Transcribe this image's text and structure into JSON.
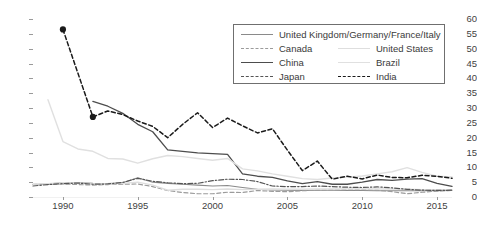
{
  "chart_data": {
    "type": "line",
    "title": "",
    "xlabel": "",
    "ylabel": "",
    "xlim": [
      1988,
      2016
    ],
    "ylim": [
      0,
      60
    ],
    "grid": true,
    "legend_position": "top-right",
    "x": [
      1988,
      1989,
      1990,
      1991,
      1992,
      1993,
      1994,
      1995,
      1996,
      1997,
      1998,
      1999,
      2000,
      2001,
      2002,
      2003,
      2004,
      2005,
      2006,
      2007,
      2008,
      2009,
      2010,
      2011,
      2012,
      2013,
      2014,
      2015,
      2016
    ],
    "yticks": [
      0,
      5,
      10,
      15,
      20,
      25,
      30,
      35,
      40,
      45,
      50,
      55,
      60
    ],
    "xticks": [
      1990,
      1995,
      2000,
      2005,
      2010,
      2015
    ],
    "series": [
      {
        "name": "United Kingdom/Germany/France/Italy",
        "color": "#8a8a8a",
        "style": "solid",
        "width": 1.1,
        "markers": false,
        "x": [
          1988,
          1989,
          1990,
          1991,
          1992,
          1993,
          1994,
          1995,
          1996,
          1997,
          1998,
          1999,
          2000,
          2001,
          2002,
          2003,
          2004,
          2005,
          2006,
          2007,
          2008,
          2009,
          2010,
          2011,
          2012,
          2013,
          2014,
          2015,
          2016
        ],
        "values": [
          4.2,
          4.4,
          4.9,
          4.9,
          4.6,
          4.5,
          4.8,
          6.5,
          5.0,
          4.6,
          4.3,
          4.0,
          3.7,
          3.9,
          3.2,
          2.6,
          2.4,
          2.3,
          2.2,
          2.3,
          2.3,
          2.2,
          2.2,
          2.1,
          2.1,
          2.1,
          2.1,
          2.1,
          2.2
        ]
      },
      {
        "name": "Canada",
        "color": "#9b9b9b",
        "style": "dashed",
        "width": 1.2,
        "markers": false,
        "x": [
          1988,
          1989,
          1990,
          1991,
          1992,
          1993,
          1994,
          1995,
          1996,
          1997,
          1998,
          1999,
          2000,
          2001,
          2002,
          2003,
          2004,
          2005,
          2006,
          2007,
          2008,
          2009,
          2010,
          2011,
          2012,
          2013,
          2014,
          2015,
          2016
        ],
        "values": [
          4.3,
          4.3,
          4.4,
          4.2,
          4.0,
          4.2,
          4.3,
          4.4,
          3.5,
          2.2,
          1.5,
          1.1,
          1.1,
          1.6,
          1.5,
          2.2,
          1.9,
          1.8,
          2.1,
          2.3,
          2.4,
          2.5,
          2.5,
          2.3,
          1.8,
          1.1,
          1.6,
          2.0,
          2.2
        ]
      },
      {
        "name": "United States",
        "color": "#dedede",
        "style": "solid",
        "width": 1.4,
        "markers": false,
        "x": [
          1988,
          1989,
          1990,
          1991,
          1992,
          1993,
          1994,
          1995,
          1996,
          1997,
          1998,
          1999,
          2000,
          2001,
          2002,
          2003,
          2004,
          2005,
          2006,
          2007,
          2008,
          2009,
          2010,
          2011,
          2012,
          2013,
          2014,
          2015,
          2016
        ],
        "values": [
          4.3,
          4.5,
          4.8,
          4.7,
          4.5,
          4.4,
          4.6,
          5.0,
          4.0,
          2.3,
          2.6,
          2.6,
          2.5,
          2.7,
          2.5,
          2.6,
          2.7,
          2.6,
          2.6,
          2.7,
          2.7,
          2.7,
          2.7,
          2.7,
          2.7,
          2.6,
          2.5,
          2.5,
          2.5
        ]
      },
      {
        "name": "China",
        "color": "#4d4d4d",
        "style": "solid",
        "width": 1.3,
        "markers": false,
        "x": [
          1992,
          1993,
          1994,
          1995,
          1996,
          1997,
          1998,
          1999,
          2000,
          2001,
          2002,
          2003,
          2004,
          2005,
          2006,
          2007,
          2008,
          2009,
          2010,
          2011,
          2012,
          2013,
          2014,
          2015,
          2016
        ],
        "values": [
          32.2,
          30.6,
          28.2,
          24.5,
          22.0,
          15.9,
          15.4,
          14.9,
          14.6,
          14.4,
          7.8,
          7.0,
          6.6,
          5.4,
          4.5,
          5.2,
          4.3,
          4.3,
          5.0,
          5.9,
          5.6,
          6.0,
          6.2,
          4.6,
          3.6
        ]
      },
      {
        "name": "Brazil",
        "color": "#e0e0e0",
        "style": "solid",
        "width": 1.4,
        "markers": false,
        "x": [
          1989,
          1990,
          1991,
          1992,
          1993,
          1994,
          1995,
          1996,
          1997,
          1998,
          1999,
          2000,
          2001,
          2002,
          2003,
          2004,
          2005,
          2006,
          2007,
          2008,
          2009,
          2010,
          2011,
          2012,
          2013,
          2014,
          2015,
          2016
        ],
        "values": [
          32.8,
          18.7,
          16.2,
          15.4,
          13.0,
          12.8,
          11.4,
          12.9,
          14.0,
          13.6,
          13.0,
          12.4,
          13.0,
          9.5,
          8.8,
          7.8,
          7.0,
          6.2,
          5.9,
          6.4,
          6.7,
          7.1,
          7.8,
          8.5,
          9.9,
          8.3,
          7.0,
          6.8
        ]
      },
      {
        "name": "Japan",
        "color": "#555555",
        "style": "dashdot",
        "width": 1.2,
        "markers": false,
        "x": [
          1988,
          1989,
          1990,
          1991,
          1992,
          1993,
          1994,
          1995,
          1996,
          1997,
          1998,
          1999,
          2000,
          2001,
          2002,
          2003,
          2004,
          2005,
          2006,
          2007,
          2008,
          2009,
          2010,
          2011,
          2012,
          2013,
          2014,
          2015,
          2016
        ],
        "values": [
          3.7,
          4.2,
          4.5,
          4.7,
          4.3,
          4.4,
          4.9,
          6.3,
          5.3,
          4.8,
          4.5,
          4.6,
          5.5,
          6.0,
          5.9,
          5.2,
          3.7,
          3.5,
          3.5,
          3.7,
          3.5,
          3.3,
          3.2,
          3.4,
          3.1,
          2.6,
          2.3,
          2.2,
          2.3
        ]
      },
      {
        "name": "India",
        "color": "#1a1a1a",
        "style": "dashed",
        "width": 1.5,
        "markers": true,
        "x": [
          1990,
          1992,
          1993,
          1994,
          1995,
          1996,
          1997,
          1998,
          1999,
          2000,
          2001,
          2002,
          2003,
          2004,
          2005,
          2006,
          2007,
          2008,
          2009,
          2010,
          2011,
          2012,
          2013,
          2014,
          2015,
          2016
        ],
        "values": [
          56.5,
          27.0,
          29.0,
          27.8,
          25.6,
          23.8,
          20.0,
          24.5,
          28.4,
          23.4,
          26.6,
          24.0,
          21.6,
          23.0,
          15.8,
          8.9,
          12.1,
          6.0,
          7.0,
          6.1,
          7.4,
          6.6,
          6.5,
          7.3,
          7.0,
          6.3
        ],
        "marker_points": [
          {
            "x": 1990,
            "y": 56.5
          },
          {
            "x": 1992,
            "y": 27.0
          }
        ]
      }
    ]
  },
  "axes": {
    "ytick_labels": [
      "60",
      "55",
      "50",
      "45",
      "40",
      "35",
      "30",
      "25",
      "20",
      "15",
      "10",
      "5",
      "0"
    ],
    "xtick_labels": [
      "1990",
      "1995",
      "2000",
      "2005",
      "2010",
      "2015"
    ]
  },
  "legend": {
    "rows": [
      {
        "label": "United Kingdom/Germany/France/Italy",
        "series": 0
      },
      {
        "label": "Canada",
        "series": 1
      },
      {
        "label": "United States",
        "series": 2
      },
      {
        "label": "China",
        "series": 3
      },
      {
        "label": "Brazil",
        "series": 4
      },
      {
        "label": "Japan",
        "series": 5
      },
      {
        "label": "India",
        "series": 6
      }
    ]
  }
}
